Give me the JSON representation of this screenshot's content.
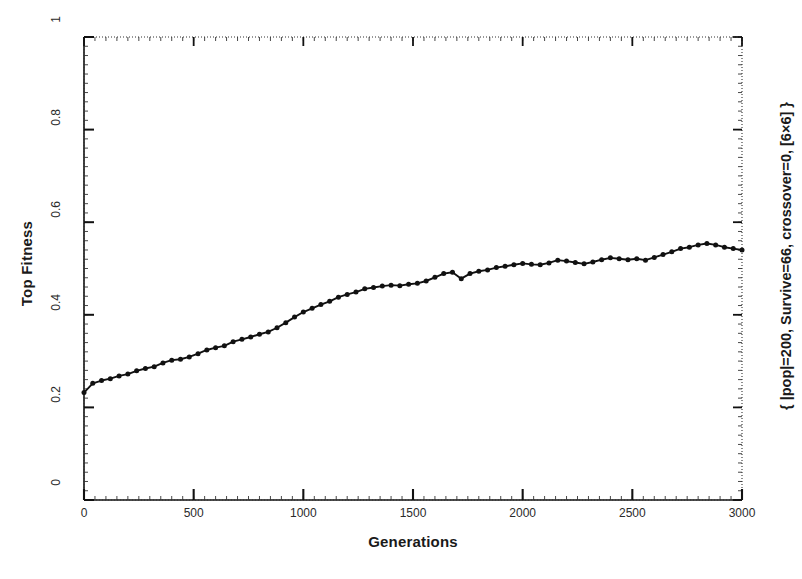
{
  "chart_data": {
    "type": "line",
    "title": "",
    "subtitle": "",
    "xlabel": "Generations",
    "ylabel": "Top Fitness",
    "right_label": "{ |pop|=200, Survive=66, crossover=0, [6×6] }",
    "xlim": [
      0,
      3000
    ],
    "ylim": [
      0,
      1
    ],
    "xticks": [
      0,
      500,
      1000,
      1500,
      2000,
      2500,
      3000
    ],
    "xtick_labels": [
      "0",
      "500",
      "1000",
      "1500",
      "2000",
      "2500",
      "3000"
    ],
    "yticks": [
      0,
      0.2,
      0.4,
      0.6,
      0.8,
      1
    ],
    "ytick_labels": [
      "0",
      "0.2",
      "0.4",
      "0.6",
      "0.8",
      "1"
    ],
    "grid": false,
    "minor_ticks": true,
    "legend": null,
    "marker": "filled-circle",
    "line_color": "#111111",
    "series": [
      {
        "name": "Top Fitness",
        "x": [
          0,
          40,
          80,
          120,
          160,
          200,
          240,
          280,
          320,
          360,
          400,
          440,
          480,
          520,
          560,
          600,
          640,
          680,
          720,
          760,
          800,
          840,
          880,
          920,
          960,
          1000,
          1040,
          1080,
          1120,
          1160,
          1200,
          1240,
          1280,
          1320,
          1360,
          1400,
          1440,
          1480,
          1520,
          1560,
          1600,
          1640,
          1680,
          1720,
          1760,
          1800,
          1840,
          1880,
          1920,
          1960,
          2000,
          2040,
          2080,
          2120,
          2160,
          2200,
          2240,
          2280,
          2320,
          2360,
          2400,
          2440,
          2480,
          2520,
          2560,
          2600,
          2640,
          2680,
          2720,
          2760,
          2800,
          2840,
          2880,
          2920,
          2960,
          3000
        ],
        "y": [
          0.232,
          0.252,
          0.258,
          0.262,
          0.268,
          0.272,
          0.279,
          0.284,
          0.288,
          0.296,
          0.302,
          0.304,
          0.309,
          0.316,
          0.324,
          0.329,
          0.333,
          0.342,
          0.347,
          0.352,
          0.358,
          0.363,
          0.372,
          0.383,
          0.395,
          0.406,
          0.414,
          0.422,
          0.429,
          0.438,
          0.444,
          0.449,
          0.456,
          0.459,
          0.462,
          0.464,
          0.463,
          0.466,
          0.468,
          0.473,
          0.481,
          0.489,
          0.492,
          0.478,
          0.489,
          0.494,
          0.497,
          0.502,
          0.505,
          0.508,
          0.511,
          0.509,
          0.508,
          0.512,
          0.518,
          0.516,
          0.513,
          0.51,
          0.514,
          0.519,
          0.523,
          0.521,
          0.519,
          0.521,
          0.518,
          0.524,
          0.53,
          0.536,
          0.543,
          0.546,
          0.551,
          0.554,
          0.551,
          0.546,
          0.543,
          0.54
        ]
      }
    ]
  }
}
